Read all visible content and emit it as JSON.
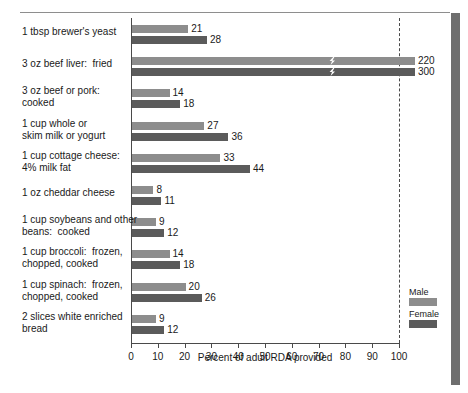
{
  "chart_data": {
    "type": "bar",
    "title": "",
    "subtitle": "",
    "xlabel": "Percent of adult RDA provided",
    "ylabel": "",
    "xlim": [
      0,
      100
    ],
    "xticks": [
      0,
      10,
      20,
      30,
      40,
      50,
      60,
      70,
      80,
      90,
      100
    ],
    "grid": false,
    "orientation": "horizontal",
    "legend_position": "right-bottom",
    "reference_line": {
      "value": 100,
      "style": "dashed",
      "label": ""
    },
    "categories": [
      "1 tbsp brewer's yeast",
      "3 oz beef liver:  fried",
      "3 oz beef or pork:\ncooked",
      "1 cup whole or\nskim milk or yogurt",
      "1 cup cottage cheese:\n4% milk fat",
      "1 oz cheddar cheese",
      "1 cup soybeans and other\nbeans:  cooked",
      "1 cup broccoli:  frozen,\nchopped, cooked",
      "1 cup spinach:  frozen,\nchopped, cooked",
      "2 slices white enriched\nbread"
    ],
    "series": [
      {
        "name": "Male",
        "color": "#8d8d8d",
        "values": [
          21,
          220,
          14,
          27,
          33,
          8,
          9,
          14,
          20,
          9
        ]
      },
      {
        "name": "Female",
        "color": "#5b5b5b",
        "values": [
          28,
          300,
          18,
          36,
          44,
          11,
          12,
          18,
          26,
          12
        ]
      }
    ],
    "broken_axis_note": "Bars for beef liver (220, 300) exceed the 0-100 axis and are drawn with a lightning-bolt break mark."
  },
  "legend": {
    "items": [
      {
        "label": "Male",
        "swatch": "male-swatch"
      },
      {
        "label": "Female",
        "swatch": "female-swatch"
      }
    ]
  },
  "axis": {
    "x_title": "Percent of adult RDA provided",
    "tick_labels": [
      "0",
      "10",
      "20",
      "30",
      "40",
      "50",
      "60",
      "70",
      "80",
      "90",
      "100"
    ]
  },
  "rows": [
    {
      "label": "1 tbsp brewer's yeast",
      "male": "21",
      "female": "28"
    },
    {
      "label": "3 oz beef liver:  fried",
      "male": "220",
      "female": "300"
    },
    {
      "label": "3 oz beef or pork:\ncooked",
      "male": "14",
      "female": "18"
    },
    {
      "label": "1 cup whole or\nskim milk or yogurt",
      "male": "27",
      "female": "36"
    },
    {
      "label": "1 cup cottage cheese:\n4% milk fat",
      "male": "33",
      "female": "44"
    },
    {
      "label": "1 oz cheddar cheese",
      "male": "8",
      "female": "11"
    },
    {
      "label": "1 cup soybeans and other\nbeans:  cooked",
      "male": "9",
      "female": "12"
    },
    {
      "label": "1 cup broccoli:  frozen,\nchopped, cooked",
      "male": "14",
      "female": "18"
    },
    {
      "label": "1 cup spinach:  frozen,\nchopped, cooked",
      "male": "20",
      "female": "26"
    },
    {
      "label": "2 slices white enriched\nbread",
      "male": "9",
      "female": "12"
    }
  ]
}
